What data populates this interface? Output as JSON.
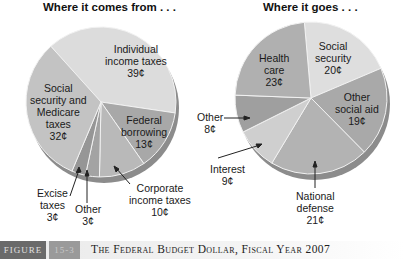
{
  "chart_data": [
    {
      "type": "pie",
      "title": "Where it comes from . . .",
      "categories": [
        "Individual income taxes",
        "Federal borrowing",
        "Corporate income taxes",
        "Other",
        "Excise taxes",
        "Social security and Medicare taxes"
      ],
      "values": [
        39,
        13,
        10,
        3,
        3,
        32
      ],
      "value_labels": [
        "39¢",
        "13¢",
        "10¢",
        "3¢",
        "3¢",
        "32¢"
      ],
      "unit": "cents per dollar",
      "start_angle_deg": -42,
      "colors": [
        "#dcdcdc",
        "#a8a8a8",
        "#b9b9b9",
        "#a3a3a3",
        "#969696",
        "#c3c3c3"
      ]
    },
    {
      "type": "pie",
      "title": "Where it goes . . .",
      "categories": [
        "Social security",
        "Other social aid",
        "National defense",
        "Interest",
        "Other",
        "Health care"
      ],
      "values": [
        20,
        19,
        21,
        9,
        8,
        23
      ],
      "value_labels": [
        "20¢",
        "19¢",
        "21¢",
        "9¢",
        "8¢",
        "23¢"
      ],
      "unit": "cents per dollar",
      "start_angle_deg": -5,
      "colors": [
        "#dedede",
        "#a9a9a9",
        "#b3b3b3",
        "#cfcfcf",
        "#9f9f9f",
        "#b0b0b0"
      ]
    }
  ],
  "left": {
    "title": "Where it comes from . . .",
    "labels": {
      "individual": [
        "Individual",
        "income taxes",
        "39¢"
      ],
      "social": [
        "Social",
        "security and",
        "Medicare",
        "taxes",
        "32¢"
      ],
      "federal": [
        "Federal",
        "borrowing",
        "13¢"
      ],
      "corporate": [
        "Corporate",
        "income taxes",
        "10¢"
      ],
      "excise": [
        "Excise",
        "taxes",
        "3¢"
      ],
      "other": [
        "Other",
        "3¢"
      ]
    }
  },
  "right": {
    "title": "Where it goes . . .",
    "labels": {
      "health": [
        "Health",
        "care",
        "23¢"
      ],
      "social": [
        "Social",
        "security",
        "20¢"
      ],
      "other_social": [
        "Other",
        "social aid",
        "19¢"
      ],
      "other": [
        "Other",
        "8¢"
      ],
      "interest": [
        "Interest",
        "9¢"
      ],
      "defense": [
        "National",
        "defense",
        "21¢"
      ]
    }
  },
  "footer": {
    "figure_word": "FIGURE",
    "figure_number": "15-3",
    "caption": "The Federal Budget Dollar, Fiscal Year 2007"
  }
}
